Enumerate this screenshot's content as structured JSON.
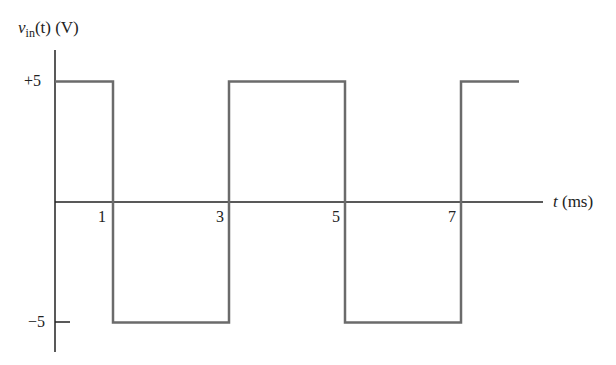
{
  "chart_data": {
    "type": "line",
    "title": "",
    "ylabel": "v_in(t) (V)",
    "ylabel_parts": {
      "var": "v",
      "sub": "in",
      "rest": "(t) (V)"
    },
    "xlabel": "t (ms)",
    "xlabel_parts": {
      "var": "t",
      "unit": "(ms)"
    },
    "x_ticks": [
      "1",
      "3",
      "5",
      "7"
    ],
    "y_ticks": [
      "+5",
      "−5"
    ],
    "ylim": [
      -5,
      5
    ],
    "xlim": [
      0,
      8
    ],
    "grid": false,
    "x": [
      0,
      1,
      1,
      3,
      3,
      5,
      5,
      7,
      7,
      8
    ],
    "y": [
      5,
      5,
      -5,
      -5,
      5,
      5,
      -5,
      -5,
      5,
      5
    ],
    "line_color": "#6b6b6b"
  }
}
